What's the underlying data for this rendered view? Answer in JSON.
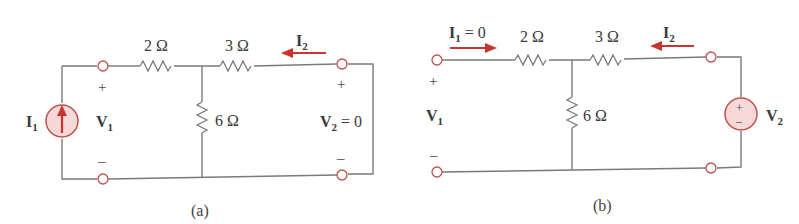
{
  "figures": [
    {
      "id": "a",
      "caption": "(a)",
      "resistors": {
        "series_left": "2 Ω",
        "series_right": "3 Ω",
        "shunt": "6 Ω"
      },
      "source": {
        "type": "current-source",
        "label": "I",
        "subscript": "1"
      },
      "port1": {
        "voltage_label": "V",
        "voltage_sub": "1",
        "plus": "+",
        "minus": "–"
      },
      "port2": {
        "voltage_label": "V",
        "voltage_sub": "2",
        "voltage_value": " = 0",
        "plus": "+",
        "minus": "–"
      },
      "current_arrow": {
        "label": "I",
        "subscript": "2",
        "direction": "left"
      }
    },
    {
      "id": "b",
      "caption": "(b)",
      "resistors": {
        "series_left": "2 Ω",
        "series_right": "3 Ω",
        "shunt": "6 Ω"
      },
      "source": {
        "type": "voltage-source",
        "label": "V",
        "subscript": "2",
        "plus": "+",
        "minus": "–"
      },
      "port1": {
        "voltage_label": "V",
        "voltage_sub": "1",
        "plus": "+",
        "minus": "–"
      },
      "current_arrow_1": {
        "label": "I",
        "subscript": "1",
        "value": " = 0",
        "direction": "right"
      },
      "current_arrow_2": {
        "label": "I",
        "subscript": "2",
        "direction": "left"
      }
    }
  ],
  "colors": {
    "wire": "#7a7a7a",
    "accent": "#c8352f",
    "source_fill": "#f7d8d8"
  }
}
